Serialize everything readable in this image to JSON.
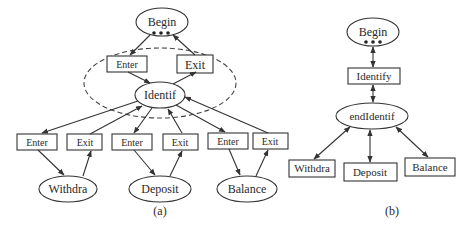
{
  "colors": {
    "stroke": "#333333",
    "text": "#2a2a2a",
    "background": "#ffffff"
  },
  "diagram_a": {
    "caption": "(a)",
    "begin": "Begin",
    "enter": "Enter",
    "exit": "Exit",
    "identif": "Identif",
    "branches": [
      {
        "enter": "Enter",
        "exit": "Exit",
        "target": "Withdra"
      },
      {
        "enter": "Enter",
        "exit": "Exit",
        "target": "Deposit"
      },
      {
        "enter": "Enter",
        "exit": "Exit",
        "target": "Balance"
      }
    ]
  },
  "diagram_b": {
    "caption": "(b)",
    "begin": "Begin",
    "identify": "Identify",
    "end_identif": "endIdentif",
    "children": [
      "Withdra",
      "Deposit",
      "Balance"
    ]
  }
}
